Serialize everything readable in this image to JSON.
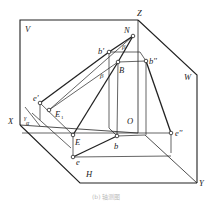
{
  "diagram": {
    "type": "axonometric projection of line on three projection planes",
    "planes": {
      "V": "V",
      "W": "W",
      "H": "H"
    },
    "axes": {
      "X": "X",
      "Y": "Y",
      "Z": "Z",
      "O": "O"
    },
    "points": {
      "N": "N",
      "b_prime": "b'",
      "B": "B",
      "b_double_prime": "b''",
      "e_prime": "e'",
      "E1": "E",
      "E1_sub": "1",
      "E": "E",
      "b": "b",
      "e": "e",
      "e_double_prime": "e''"
    },
    "angles": {
      "beta_top": "β",
      "beta_mid": "β",
      "gamma": "γ",
      "alpha": "α"
    },
    "caption": "(b) 轴测图"
  }
}
